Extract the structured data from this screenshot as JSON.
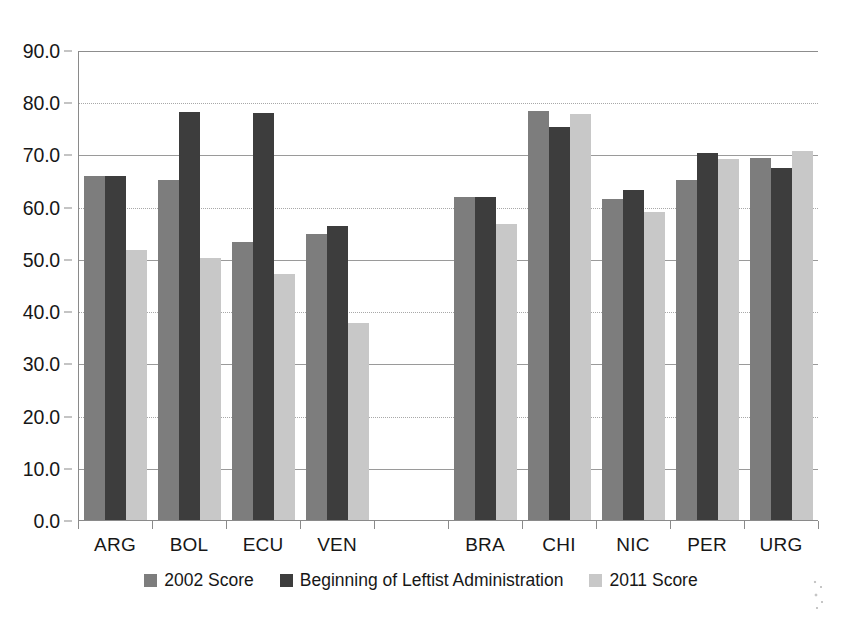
{
  "chart_data": {
    "type": "bar",
    "title": "",
    "subtitle": "",
    "xlabel": "",
    "ylabel": "",
    "ylim": [
      0.0,
      90.0
    ],
    "ytick_labels": [
      "90.0",
      "80.0",
      "70.0",
      "60.0",
      "50.0",
      "40.0",
      "30.0",
      "20.0",
      "10.0",
      "0.0"
    ],
    "ytick_values": [
      90.0,
      80.0,
      70.0,
      60.0,
      50.0,
      40.0,
      30.0,
      20.0,
      10.0,
      0.0
    ],
    "grid": true,
    "legend_position": "bottom",
    "categories": [
      "ARG",
      "BOL",
      "ECU",
      "VEN",
      "",
      "BRA",
      "CHI",
      "NIC",
      "PER",
      "URG"
    ],
    "series": [
      {
        "name": "2002 Score",
        "color": "#7d7d7d",
        "values": [
          65.8,
          65.2,
          53.3,
          54.8,
          null,
          61.8,
          78.4,
          61.5,
          65.2,
          69.4
        ]
      },
      {
        "name": "Beginning of Leftist Administration",
        "color": "#3d3d3d",
        "values": [
          65.8,
          78.1,
          77.9,
          56.3,
          null,
          61.9,
          75.2,
          63.2,
          70.2,
          67.5
        ]
      },
      {
        "name": "2011 Score",
        "color": "#c8c8c8",
        "values": [
          51.8,
          50.1,
          47.2,
          37.7,
          null,
          56.7,
          77.8,
          59.0,
          69.2,
          70.6
        ]
      }
    ]
  },
  "legend": {
    "items": [
      {
        "label": "2002 Score",
        "color": "#7d7d7d"
      },
      {
        "label": "Beginning of Leftist Administration",
        "color": "#3d3d3d"
      },
      {
        "label": "2011 Score",
        "color": "#c8c8c8"
      }
    ]
  }
}
